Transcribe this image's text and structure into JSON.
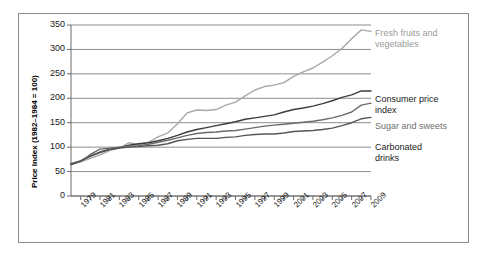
{
  "chart_data": {
    "type": "line",
    "title": "",
    "xlabel": "",
    "ylabel": "Price Index (1982–1984 = 100)",
    "ylim": [
      0,
      350
    ],
    "xlim": [
      1978,
      2009
    ],
    "grid": "horizontal",
    "legend_position": "right-inline-labels",
    "yticks": [
      "0",
      "50",
      "100",
      "150",
      "200",
      "250",
      "300",
      "350"
    ],
    "ytick_values": [
      0,
      50,
      100,
      150,
      200,
      250,
      300,
      350
    ],
    "xticks": [
      "1979",
      "1981",
      "1983",
      "1985",
      "1987",
      "1989",
      "1991",
      "1993",
      "1995",
      "1997",
      "1999",
      "2001",
      "2003",
      "2005",
      "2007",
      "2009"
    ],
    "xtick_values": [
      1979,
      1981,
      1983,
      1985,
      1987,
      1989,
      1991,
      1993,
      1995,
      1997,
      1999,
      2001,
      2003,
      2005,
      2007,
      2009
    ],
    "minor_tick_interval_years": 1,
    "x": [
      1978,
      1979,
      1980,
      1981,
      1982,
      1983,
      1984,
      1985,
      1986,
      1987,
      1988,
      1989,
      1990,
      1991,
      1992,
      1993,
      1994,
      1995,
      1996,
      1997,
      1998,
      1999,
      2000,
      2001,
      2002,
      2003,
      2004,
      2005,
      2006,
      2007,
      2008,
      2009
    ],
    "series": [
      {
        "name": "Fresh fruits and vegetables",
        "color": "#a8a8a8",
        "label_color": "#9a9a9a",
        "label_lines": "Fresh fruits and\nvegetables",
        "values": [
          65,
          70,
          77,
          84,
          93,
          98,
          109,
          105,
          110,
          121,
          129,
          148,
          170,
          176,
          175,
          177,
          186,
          192,
          205,
          217,
          224,
          227,
          232,
          245,
          254,
          262,
          274,
          287,
          302,
          322,
          340,
          337
        ]
      },
      {
        "name": "Consumer price index",
        "color": "#3c3c3c",
        "label_color": "#1a1a1a",
        "label_lines": "Consumer price\nindex",
        "values": [
          65,
          72,
          82,
          90,
          96,
          99,
          104,
          107,
          109,
          113,
          118,
          124,
          131,
          136,
          140,
          144,
          148,
          152,
          157,
          160,
          163,
          166,
          172,
          177,
          180,
          184,
          189,
          195,
          202,
          207,
          215,
          215
        ]
      },
      {
        "name": "Sugar and sweets",
        "color": "#6a6a6a",
        "label_color": "#6f6f6f",
        "label_lines": "Sugar and sweets",
        "values": [
          64,
          71,
          85,
          96,
          98,
          100,
          102,
          103,
          106,
          110,
          114,
          119,
          124,
          128,
          130,
          131,
          133,
          134,
          137,
          140,
          143,
          145,
          147,
          149,
          151,
          153,
          156,
          160,
          165,
          172,
          186,
          190
        ]
      },
      {
        "name": "Carbonated drinks",
        "color": "#555555",
        "label_color": "#1a1a1a",
        "label_lines": "Carbonated\ndrinks",
        "values": [
          66,
          72,
          81,
          89,
          95,
          98,
          100,
          101,
          103,
          104,
          107,
          113,
          116,
          118,
          118,
          118,
          120,
          121,
          124,
          126,
          127,
          127,
          129,
          132,
          133,
          134,
          136,
          139,
          144,
          150,
          158,
          161
        ]
      }
    ]
  },
  "axis": {
    "y_title": "Price Index (1982–1984 = 100)"
  }
}
